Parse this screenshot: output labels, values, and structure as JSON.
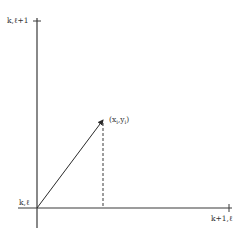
{
  "diagram": {
    "type": "coordinate-vector-diagram",
    "labels": {
      "top_left": "k,ℓ+1",
      "origin": "k,ℓ",
      "bottom_right": "k+1,ℓ",
      "point_open": "(x",
      "point_sub_x": "i",
      "point_sep": ",y",
      "point_sub_y": "i",
      "point_close": ")"
    },
    "colors": {
      "line": "#3a3a3a",
      "text": "#333333",
      "background": "#ffffff"
    },
    "geometry": {
      "origin": [
        37,
        208
      ],
      "point": [
        103,
        119
      ],
      "x_axis_end": [
        232,
        208
      ],
      "y_axis_top": [
        37,
        18
      ]
    }
  }
}
